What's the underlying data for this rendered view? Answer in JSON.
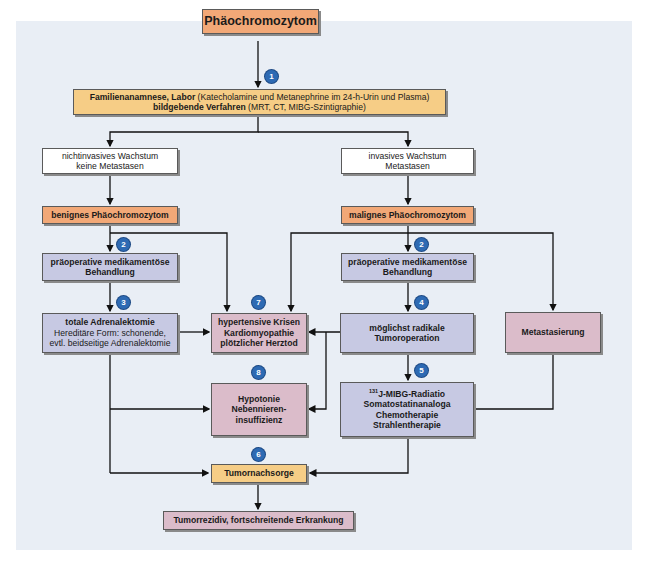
{
  "diagram": {
    "title": "Phäochromozytom",
    "nodes": {
      "diagnostics": {
        "line1_bold": "Familienanamnese, Labor",
        "line1_rest": " (Katecholamine und Metanephrine im 24-h-Urin und Plasma)",
        "line2_bold": "bildgebende Verfahren",
        "line2_rest": " (MRT, CT, MIBG-Szintigraphie)"
      },
      "noninvasive": {
        "line1": "nichtinvasives Wachstum",
        "line2": "keine Metastasen"
      },
      "invasive": {
        "line1": "invasives Wachstum",
        "line2": "Metastasen"
      },
      "benign": {
        "label": "benignes Phäochromozytom"
      },
      "malignant": {
        "label": "malignes Phäochromozytom"
      },
      "preop_left": {
        "line1": "präoperative medikamentöse",
        "line2": "Behandlung"
      },
      "preop_right": {
        "line1": "präoperative medikamentöse",
        "line2": "Behandlung"
      },
      "adrenalectomy": {
        "line1": "totale Adrenalektomie",
        "line2": "Hereditäre Form: schonende,",
        "line3": "evtl. beidseitige Adrenalektomie"
      },
      "crises": {
        "line1": "hypertensive Krisen",
        "line2": "Kardiomyopathie",
        "line3": "plötzlicher Herztod"
      },
      "tumor_op": {
        "line1": "möglichst radikale",
        "line2": "Tumoroperation"
      },
      "metastasis": {
        "label": "Metastasierung"
      },
      "hypotonia": {
        "line1": "Hypotonie",
        "line2": "Nebennieren-",
        "line3": "insuffizienz"
      },
      "therapy": {
        "sup": "131",
        "line1": "J-MIBG-Radiatio",
        "line2": "Somatostatinanaloga",
        "line3": "Chemotherapie",
        "line4": "Strahlentherapie"
      },
      "followup": {
        "label": "Tumornachsorge"
      },
      "recurrence": {
        "label": "Tumorrezidiv, fortschreitende Erkrankung"
      }
    },
    "badges": [
      "1",
      "2",
      "2",
      "3",
      "4",
      "5",
      "6",
      "7",
      "8"
    ],
    "colors": {
      "panel": "#e9eef5",
      "orange": "#f2a877",
      "yellow": "#f6cd86",
      "lavender": "#c7c9e3",
      "pink": "#dbbcca",
      "badge": "#2e6ab3"
    }
  }
}
